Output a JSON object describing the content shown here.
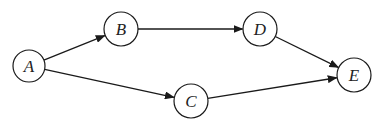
{
  "diagram": {
    "type": "directed-graph",
    "colors": {
      "stroke": "#1a1a1a",
      "text": "#222222",
      "background": "#ffffff"
    },
    "nodes": [
      {
        "id": "A",
        "label": "A",
        "cx": 29,
        "cy": 66,
        "r": 16
      },
      {
        "id": "B",
        "label": "B",
        "cx": 121,
        "cy": 29,
        "r": 17
      },
      {
        "id": "C",
        "label": "C",
        "cx": 191,
        "cy": 101,
        "r": 17
      },
      {
        "id": "D",
        "label": "D",
        "cx": 260,
        "cy": 29,
        "r": 17
      },
      {
        "id": "E",
        "label": "E",
        "cx": 354,
        "cy": 75,
        "r": 17
      }
    ],
    "edges": [
      {
        "from": "A",
        "to": "B"
      },
      {
        "from": "A",
        "to": "C"
      },
      {
        "from": "B",
        "to": "D"
      },
      {
        "from": "D",
        "to": "E"
      },
      {
        "from": "C",
        "to": "E"
      }
    ]
  }
}
